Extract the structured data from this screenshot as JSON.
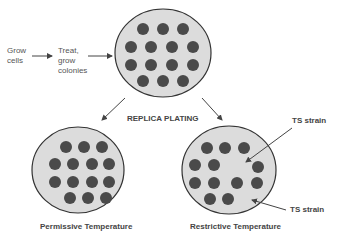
{
  "steps": {
    "grow_cells": "Grow\ncells",
    "treat": "Treat,\ngrow\ncolonies"
  },
  "process_label": "REPLICA PLATING",
  "plates": {
    "master": {
      "colony_count": 14
    },
    "permissive": {
      "label": "Permissive Temperature",
      "colony_count": 14
    },
    "restrictive": {
      "label": "Restrictive Temperature",
      "colony_count": 12
    }
  },
  "annotations": {
    "ts_strain_1": "TS strain",
    "ts_strain_2": "TS strain"
  },
  "colors": {
    "plate_fill": "#dcdcdc",
    "plate_stroke": "#333333",
    "colony": "#4a4a4a",
    "arrow": "#444444",
    "text": "#555555"
  }
}
